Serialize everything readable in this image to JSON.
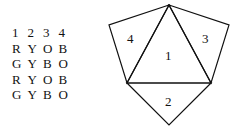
{
  "table": {
    "header": [
      "1",
      "2",
      "3",
      "4"
    ],
    "rows": [
      [
        "R",
        "Y",
        "O",
        "B"
      ],
      [
        "G",
        "Y",
        "B",
        "O"
      ],
      [
        "R",
        "Y",
        "O",
        "B"
      ],
      [
        "G",
        "Y",
        "B",
        "O"
      ]
    ]
  },
  "diagram": {
    "face_labels": {
      "center": "1",
      "bottom": "2",
      "right": "3",
      "left": "4"
    }
  }
}
